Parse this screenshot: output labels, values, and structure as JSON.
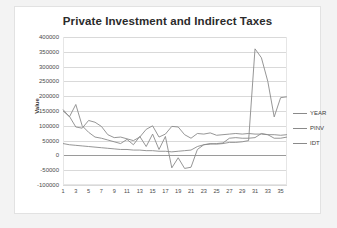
{
  "chart_data": {
    "type": "line",
    "title": "Private Investment and Indirect Taxes",
    "xlabel": "",
    "ylabel": "Value",
    "ylim": [
      -100000,
      400000
    ],
    "ytick_step": 50000,
    "yticks": [
      "400000",
      "350000",
      "300000",
      "250000",
      "200000",
      "150000",
      "100000",
      "50000",
      "0",
      "-50000",
      "-100000"
    ],
    "xlim": [
      1,
      36
    ],
    "xticks": [
      "1",
      "3",
      "5",
      "7",
      "9",
      "11",
      "13",
      "15",
      "17",
      "19",
      "21",
      "23",
      "25",
      "27",
      "29",
      "31",
      "33",
      "35"
    ],
    "x": [
      1,
      2,
      3,
      4,
      5,
      6,
      7,
      8,
      9,
      10,
      11,
      12,
      13,
      14,
      15,
      16,
      17,
      18,
      19,
      20,
      21,
      22,
      23,
      24,
      25,
      26,
      27,
      28,
      29,
      30,
      31,
      32,
      33,
      34,
      35,
      36
    ],
    "grid": true,
    "legend_position": "right",
    "series": [
      {
        "name": "YEAR",
        "values": [
          155000,
          130000,
          172000,
          100000,
          78000,
          62000,
          58000,
          52000,
          46000,
          40000,
          54000,
          36000,
          64000,
          30000,
          72000,
          20000,
          64000,
          -42000,
          -8000,
          -44000,
          -40000,
          20000,
          36000,
          40000,
          38000,
          40000,
          44000,
          44000,
          46000,
          50000,
          360000,
          330000,
          250000,
          130000,
          195000,
          198000
        ]
      },
      {
        "name": "PINV",
        "values": [
          150000,
          132000,
          96000,
          92000,
          118000,
          112000,
          98000,
          70000,
          60000,
          62000,
          56000,
          50000,
          62000,
          88000,
          100000,
          62000,
          72000,
          98000,
          96000,
          70000,
          58000,
          74000,
          72000,
          76000,
          68000,
          70000,
          72000,
          74000,
          72000,
          74000,
          72000,
          72000,
          70000,
          70000,
          68000,
          70000
        ]
      },
      {
        "name": "IDT",
        "values": [
          40000,
          36000,
          34000,
          32000,
          30000,
          28000,
          26000,
          24000,
          22000,
          20000,
          20000,
          18000,
          18000,
          16000,
          16000,
          14000,
          14000,
          12000,
          14000,
          16000,
          18000,
          30000,
          36000,
          38000,
          40000,
          42000,
          58000,
          60000,
          58000,
          58000,
          60000,
          74000,
          70000,
          58000,
          58000,
          62000
        ]
      }
    ]
  },
  "legend": [
    {
      "label": "YEAR"
    },
    {
      "label": "PINV"
    },
    {
      "label": "IDT"
    }
  ],
  "colors": {
    "title": "#2b2b2b",
    "gridline": "#d9d9d9",
    "axis": "#9a9a9a",
    "series_line": "#8a8a8a",
    "plot_background": "#ffffff",
    "page_background": "#f3f3f3"
  }
}
